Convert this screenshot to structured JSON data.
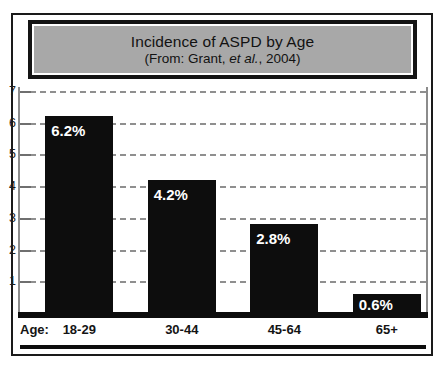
{
  "chart_data": {
    "type": "bar",
    "title": "Incidence of ASPD by Age",
    "subtitle_prefix": "(From: Grant, ",
    "subtitle_italic": "et al.",
    "subtitle_suffix": ", 2004)",
    "xlabel": "Age:",
    "ylabel": "",
    "categories": [
      "18-29",
      "30-44",
      "45-64",
      "65+"
    ],
    "values": [
      6.2,
      4.2,
      2.8,
      0.6
    ],
    "data_labels": [
      "6.2%",
      "4.2%",
      "2.8%",
      "0.6%"
    ],
    "ylim": [
      0,
      7
    ],
    "yticks": [
      1,
      2,
      3,
      4,
      5,
      6,
      7
    ],
    "ytick_labels": [
      "1",
      "2",
      "3",
      "4",
      "5",
      "6",
      "7"
    ],
    "grid": true,
    "grid_style": "dashed",
    "legend": "none",
    "bar_color": "#0d0d0d",
    "grid_color": "#8f8f8f",
    "title_fill_color": "#a8a8a8",
    "background_color": "#ffffff"
  }
}
